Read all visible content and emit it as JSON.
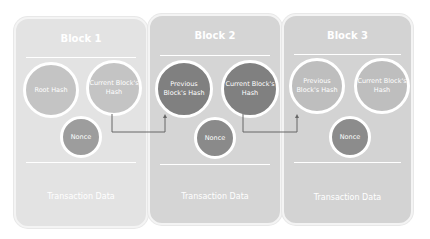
{
  "colors": {
    "block1_bg": "#e3e3e3",
    "block1_circle": "#c4c4c4",
    "block1_nonce": "#9d9d9d",
    "block2_bg": "#d5d5d5",
    "block2_circle": "#808080",
    "block2_nonce": "#8a8a8a",
    "block3_bg": "#d3d3d3",
    "block3_circle": "#bebebe",
    "block3_nonce": "#8c8c8c",
    "arrow": "#666666"
  },
  "blocks": [
    {
      "title": "Block 1",
      "left_circle": "Root Hash",
      "right_circle": "Current Block's Hash",
      "nonce": "Nonce",
      "footer": "Transaction Data"
    },
    {
      "title": "Block 2",
      "left_circle": "Previous Block's Hash",
      "right_circle": "Current Block's Hash",
      "nonce": "Nonce",
      "footer": "Transaction Data"
    },
    {
      "title": "Block 3",
      "left_circle": "Previous Block's Hash",
      "right_circle": "Current Block's Hash",
      "nonce": "Nonce",
      "footer": "Transaction Data"
    }
  ],
  "connections": [
    {
      "from": "Block 1 Current Block's Hash",
      "to": "Block 2 Previous Block's Hash"
    },
    {
      "from": "Block 2 Current Block's Hash",
      "to": "Block 3 Previous Block's Hash"
    }
  ]
}
